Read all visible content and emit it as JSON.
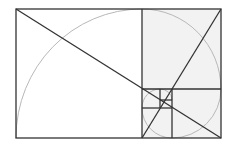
{
  "diagram": {
    "colors": {
      "background": "#ffffff",
      "line": "#333333",
      "spiral": "#b8b8b8",
      "fill": "#f2f2f2"
    },
    "outer_rect": {
      "x": 16,
      "y": 9,
      "w": 205,
      "h": 129
    },
    "squares": [
      {
        "x": 16,
        "y": 9,
        "w": 126,
        "h": 129
      },
      {
        "x": 142,
        "y": 9,
        "w": 79,
        "h": 80
      },
      {
        "x": 172,
        "y": 89,
        "w": 49,
        "h": 49
      },
      {
        "x": 142,
        "y": 108,
        "w": 30,
        "h": 30
      },
      {
        "x": 142,
        "y": 89,
        "w": 18,
        "h": 19
      },
      {
        "x": 160,
        "y": 89,
        "w": 12,
        "h": 11
      }
    ],
    "diagonals": [
      {
        "x1": 16,
        "y1": 9,
        "x2": 221,
        "y2": 138
      },
      {
        "x1": 142,
        "y1": 138,
        "x2": 221,
        "y2": 9
      }
    ]
  }
}
